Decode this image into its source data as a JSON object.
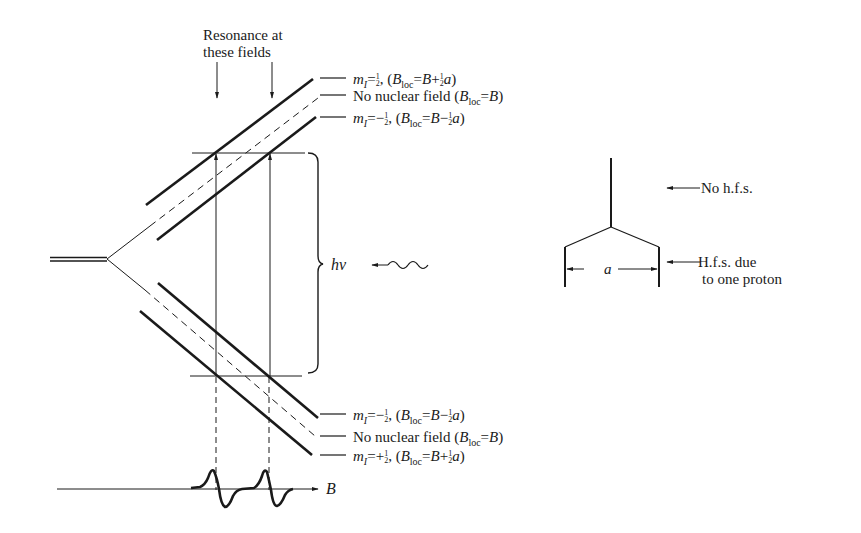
{
  "diagram": {
    "type": "energy-level-diagram",
    "resonance_label_line1": "Resonance at",
    "resonance_label_line2": "these fields",
    "upper_levels": [
      {
        "mi": "m_I=1/2",
        "mi_sym": "m",
        "mi_sub": "I",
        "mi_eq": "=",
        "mi_sign": "",
        "field_text": "(B_loc = B + 1/2 a)",
        "sign": "+"
      },
      {
        "label": "No nuclear field",
        "field_text": "(B_loc = B)"
      },
      {
        "mi": "m_I=-1/2",
        "mi_sym": "m",
        "mi_sub": "I",
        "mi_eq": "=",
        "mi_sign": "−",
        "field_text": "(B_loc = B − 1/2 a)",
        "sign": "−"
      }
    ],
    "lower_levels": [
      {
        "mi": "m_I=-1/2",
        "mi_sym": "m",
        "mi_sub": "I",
        "mi_eq": "=",
        "mi_sign": "−",
        "field_text": "(B_loc = B − 1/2 a)",
        "sign": "−"
      },
      {
        "label": "No nuclear field",
        "field_text": "(B_loc = B)"
      },
      {
        "mi": "m_I=+1/2",
        "mi_sym": "m",
        "mi_sub": "I",
        "mi_eq": "=",
        "mi_sign": "+",
        "field_text": "(B_loc = B + 1/2 a)",
        "sign": "+"
      }
    ],
    "photon_label": "hν",
    "field_axis_label": "B",
    "loc_sub": "loc",
    "B_sym": "B",
    "a_sym": "a",
    "half_num": "1",
    "half_den": "2",
    "no_nuclear_field": "No nuclear field",
    "stick_spectrum": {
      "no_hfs_label": "No h.f.s.",
      "hfs_label_line1": "H.f.s. due",
      "hfs_label_line2": "to one proton",
      "splitting_label": "a"
    }
  }
}
